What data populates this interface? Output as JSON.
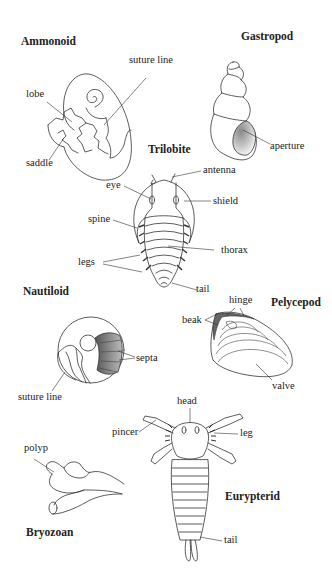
{
  "figure": {
    "background": "#ffffff",
    "ink_color": "#222222"
  },
  "fossils": {
    "ammonoid": {
      "title": "Ammonoid",
      "labels": {
        "suture_line": "suture line",
        "lobe": "lobe",
        "saddle": "saddle"
      }
    },
    "gastropod": {
      "title": "Gastropod",
      "labels": {
        "aperture": "aperture"
      }
    },
    "trilobite": {
      "title": "Trilobite",
      "labels": {
        "antenna": "antenna",
        "eye": "eye",
        "shield": "shield",
        "spine": "spine",
        "thorax": "thorax",
        "legs": "legs",
        "tail": "tail"
      }
    },
    "nautiloid": {
      "title": "Nautiloid",
      "labels": {
        "septa": "septa",
        "suture_line": "suture line"
      }
    },
    "pelycepod": {
      "title": "Pelycepod",
      "labels": {
        "hinge": "hinge",
        "beak": "beak",
        "valve": "valve"
      }
    },
    "eurypterid": {
      "title": "Eurypterid",
      "labels": {
        "head": "head",
        "pincer": "pincer",
        "leg": "leg",
        "tail": "tail"
      }
    },
    "bryozoan": {
      "title": "Bryozoan",
      "labels": {
        "polyp": "polyp"
      }
    }
  }
}
